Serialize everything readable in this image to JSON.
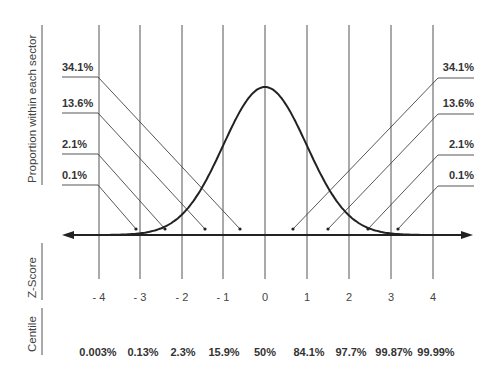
{
  "chart_data": {
    "type": "line",
    "title": "",
    "xlabel": "Z-Score",
    "ylabel": "Proportion within each sector",
    "row_labels": {
      "zscore": "Z-Score",
      "centile": "Centile"
    },
    "x_ticks": [
      "- 4",
      "- 3",
      "- 2",
      "- 1",
      "0",
      "1",
      "2",
      "3",
      "4"
    ],
    "z_values": [
      -4,
      -3,
      -2,
      -1,
      0,
      1,
      2,
      3,
      4
    ],
    "centiles": [
      "0.003%",
      "0.13%",
      "2.3%",
      "15.9%",
      "50%",
      "84.1%",
      "97.7%",
      "99.87%",
      "99.99%"
    ],
    "sector_proportions_left": [
      "34.1%",
      "13.6%",
      "2.1%",
      "0.1%"
    ],
    "sector_proportions_right": [
      "34.1%",
      "13.6%",
      "2.1%",
      "0.1%"
    ],
    "sectors": [
      {
        "range": [
          -4,
          -3
        ],
        "proportion": "0.1%"
      },
      {
        "range": [
          -3,
          -2
        ],
        "proportion": "2.1%"
      },
      {
        "range": [
          -2,
          -1
        ],
        "proportion": "13.6%"
      },
      {
        "range": [
          -1,
          0
        ],
        "proportion": "34.1%"
      },
      {
        "range": [
          0,
          1
        ],
        "proportion": "34.1%"
      },
      {
        "range": [
          1,
          2
        ],
        "proportion": "13.6%"
      },
      {
        "range": [
          2,
          3
        ],
        "proportion": "2.1%"
      },
      {
        "range": [
          3,
          4
        ],
        "proportion": "0.1%"
      }
    ],
    "xlim": [
      -4,
      4
    ],
    "grid": "vertical lines at each integer z",
    "legend": "none"
  }
}
